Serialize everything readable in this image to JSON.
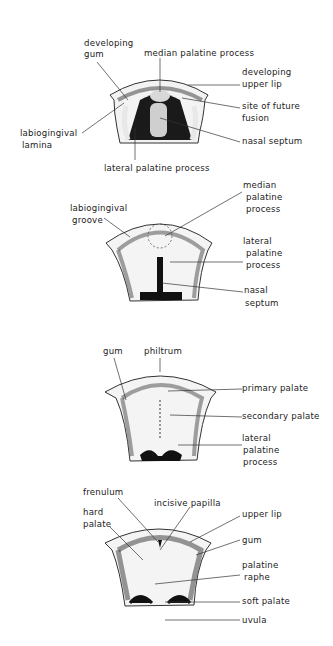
{
  "figure": {
    "type": "anatomical-diagram",
    "panels": [
      {
        "id": "stage1",
        "labels": {
          "developing_gum": [
            "developing",
            "gum"
          ],
          "median_palatine_process": "median palatine process",
          "developing_upper_lip": [
            "developing",
            "upper lip"
          ],
          "site_of_future_fusion": [
            "site of future",
            "fusion"
          ],
          "labiogingival_lamina": [
            "labiogingival",
            "lamina"
          ],
          "nasal_septum": "nasal septum",
          "lateral_palatine_process": "lateral palatine process"
        }
      },
      {
        "id": "stage2",
        "labels": {
          "labiogingival_groove": [
            "labiogingival",
            "groove"
          ],
          "median_palatine_process": [
            "median",
            "palatine",
            "process"
          ],
          "lateral_palatine_process": [
            "lateral",
            "palatine",
            "process"
          ],
          "nasal_septum": [
            "nasal",
            "septum"
          ]
        }
      },
      {
        "id": "stage3",
        "labels": {
          "gum": "gum",
          "philtrum": "philtrum",
          "primary_palate": "primary palate",
          "secondary_palate": "secondary palate",
          "lateral_palatine_process": [
            "lateral",
            "palatine",
            "process"
          ]
        }
      },
      {
        "id": "stage4",
        "labels": {
          "frenulum": "frenulum",
          "hard_palate": [
            "hard",
            "palate"
          ],
          "incisive_papilla": "incisive papilla",
          "upper_lip": "upper lip",
          "gum": "gum",
          "palatine_raphe": [
            "palatine",
            "raphe"
          ],
          "soft_palate": "soft palate",
          "uvula": "uvula"
        }
      }
    ]
  }
}
